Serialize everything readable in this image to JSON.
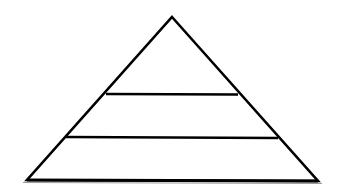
{
  "diagram": {
    "type": "pyramid",
    "levels": 3,
    "labels": [],
    "colors": {
      "background": "#ffffff",
      "stroke": "#000000",
      "shadow": "#9a9a9a"
    },
    "geometry": {
      "apex": [
        172,
        17
      ],
      "base_left": [
        27,
        180
      ],
      "base_right": [
        318,
        181
      ],
      "dividers": [
        {
          "y": 94,
          "x1": 106,
          "x2": 238
        },
        {
          "y": 137,
          "x1": 66,
          "x2": 278
        }
      ],
      "stroke_width": 2.6
    }
  }
}
